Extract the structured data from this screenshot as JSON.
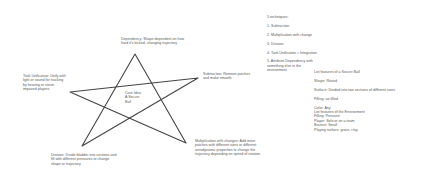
{
  "diagram": {
    "center": "Core Idea:\nA Soccer\nBall",
    "branches": {
      "top": "Dependency: Shape dependent on how\nhard it's kicked, changing trajectory",
      "left": "Task Unification: Unify with\nlight or sound for tracking\nby hearing or vision\nimpaired players",
      "right": "Subtraction: Remove patches\nand make smooth",
      "bottom_left": "Division: Divide bladder into sections and\nfill with different pressures to change\nshape or trajectory",
      "bottom_right": "Multiplication with changes: Add more\npatches with different sizes or different\naerodynamic properties to change the\ntrajectory depending on speed of rotation"
    },
    "techniques": {
      "title": "5 techniques:",
      "items": [
        "1. Subtraction",
        "2. Multiplication with change",
        "3. Division",
        "4. Task Unification ≈ Integration",
        "5. Attribute Dependency with\nsomething else in the\nenvironment"
      ]
    },
    "ball_features": {
      "title": "List features of a Soccer Ball",
      "items": [
        "Shape: Round",
        "Surface: Divided into two sections of different sizes",
        "Filling: air-filled",
        "Color: Any",
        "Filling: Pressure",
        "Bounce: Small"
      ]
    },
    "environment_features": {
      "title": "List features of the Environment",
      "items": [
        "Player: Solo or on a team",
        "Playing surface: grass, clay"
      ]
    },
    "ink_color": "#444444"
  }
}
